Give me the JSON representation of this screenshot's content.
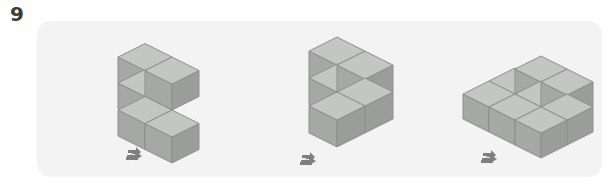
{
  "worksheet": {
    "question_number": "9",
    "background_color": "#ffffff",
    "panel_color": "#f2f3f2"
  },
  "palette": {
    "face_top": "#c4c6c4",
    "face_left": "#a6a8a6",
    "face_right": "#9b9d9b",
    "edge": "#8d8f8d",
    "arrow": "#7e807e",
    "number": "#3b3b3b"
  },
  "figures": [
    {
      "name": "figure-1",
      "label": "left-shape",
      "cube_count": 5,
      "origin_x": 38,
      "origin_y": 62,
      "cube_size": 27,
      "description": "Two-high left column with one cube on its right at top level, plus a two-high column stepped down and forward at the right.",
      "arrow": {
        "x": 50,
        "y": 125,
        "direction": "right"
      },
      "cubes": [
        {
          "gx": 0,
          "gy": 0,
          "gz": 0
        },
        {
          "gx": 0,
          "gy": 0,
          "gz": 1
        },
        {
          "gx": 1,
          "gy": 0,
          "gz": 1
        },
        {
          "gx": 1,
          "gy": 1,
          "gz": 0
        },
        {
          "gx": 2,
          "gy": 1,
          "gz": 0
        }
      ]
    },
    {
      "name": "figure-2",
      "label": "middle-shape",
      "cube_count": 5,
      "origin_x": 230,
      "origin_y": 57,
      "cube_size": 28,
      "description": "A two-by-two upright wall at the back with one cube pushed forward at the bottom right.",
      "arrow": {
        "x": 32,
        "y": 130,
        "direction": "right"
      },
      "cubes": [
        {
          "gx": 0,
          "gy": 0,
          "gz": 0
        },
        {
          "gx": 0,
          "gy": 0,
          "gz": 1
        },
        {
          "gx": 1,
          "gy": 0,
          "gz": 0
        },
        {
          "gx": 1,
          "gy": 0,
          "gz": 1
        },
        {
          "gx": 1,
          "gy": 1,
          "gz": 0
        }
      ]
    },
    {
      "name": "figure-3",
      "label": "right-shape",
      "cube_count": 8,
      "origin_x": 408,
      "origin_y": 60,
      "cube_size": 26,
      "description": "A three-wide by two-deep base layer with two cubes on the upper level, one at the back middle and one at the back right.",
      "arrow": {
        "x": 35,
        "y": 128,
        "direction": "right"
      },
      "cubes": [
        {
          "gx": 0,
          "gy": 0,
          "gz": 0
        },
        {
          "gx": 1,
          "gy": 0,
          "gz": 0
        },
        {
          "gx": 2,
          "gy": 0,
          "gz": 0
        },
        {
          "gx": 0,
          "gy": 1,
          "gz": 0
        },
        {
          "gx": 1,
          "gy": 1,
          "gz": 0
        },
        {
          "gx": 2,
          "gy": 1,
          "gz": 0
        },
        {
          "gx": 1,
          "gy": 0,
          "gz": 1
        },
        {
          "gx": 2,
          "gy": 0,
          "gz": 1
        }
      ]
    }
  ]
}
